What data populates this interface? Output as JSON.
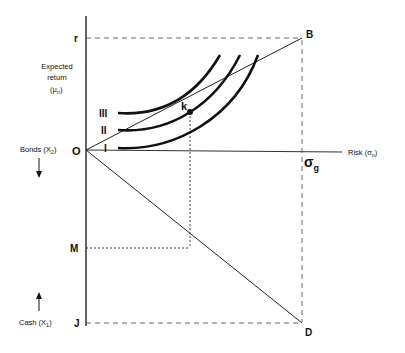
{
  "diagram": {
    "type": "portfolio-choice-diagram",
    "axes": {
      "vertical_upper_label": [
        "Expected",
        "return",
        "(μ",
        "n",
        ")"
      ],
      "horizontal_label": "Risk (σ",
      "horizontal_label_sub": "n",
      "horizontal_label_close": ")",
      "lower_label_bonds": "Bonds (X",
      "lower_label_bonds_sub": "2",
      "lower_label_cash": "Cash (X",
      "lower_label_cash_sub": "1",
      "close_paren": ")"
    },
    "points": {
      "r": "r",
      "B": "B",
      "O": "O",
      "M": "M",
      "J": "J",
      "D": "D",
      "k": "k",
      "sigma": "σ",
      "sigma_sub": "g"
    },
    "indifference_curves": [
      "III",
      "II",
      "I"
    ],
    "colors": {
      "line": "#111111",
      "dashed": "#555555",
      "background": "#ffffff"
    }
  }
}
